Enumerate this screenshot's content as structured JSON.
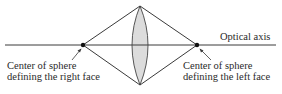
{
  "diagram": {
    "type": "converging-lens-geometry",
    "labels": {
      "optical_axis": "Optical axis",
      "left_center_line1": "Center of sphere",
      "left_center_line2": "defining the right face",
      "right_center_line1": "Center of sphere",
      "right_center_line2": "defining the left face"
    },
    "colors": {
      "line": "#3a3a3a",
      "lens_fill": "#dcdcdc",
      "lens_stroke": "#555555",
      "text": "#2a2a2a"
    }
  }
}
